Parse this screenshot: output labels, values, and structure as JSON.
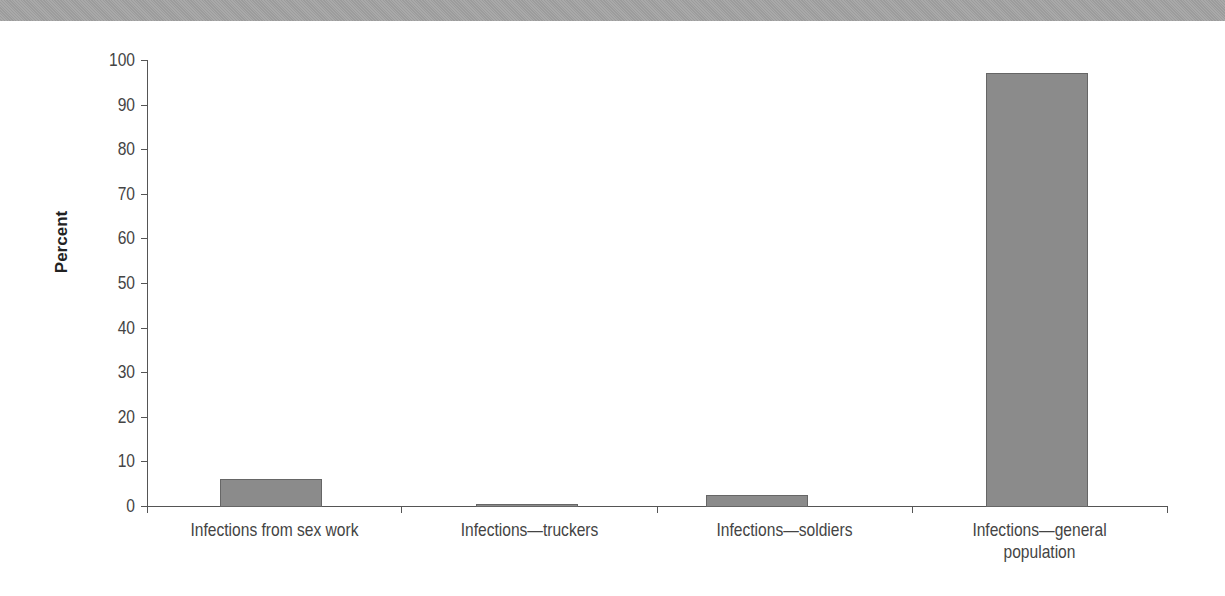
{
  "chart_data": {
    "type": "bar",
    "title": "",
    "xlabel": "",
    "ylabel": "Percent",
    "ylim": [
      0,
      100
    ],
    "yticks": [
      0,
      10,
      20,
      30,
      40,
      50,
      60,
      70,
      80,
      90,
      100
    ],
    "grid": false,
    "legend": null,
    "categories": [
      "Infections from sex work",
      "Infections—truckers",
      "Infections—soldiers",
      "Infections—general population"
    ],
    "values": [
      6,
      0.5,
      2.4,
      97
    ],
    "bar_color": "#8b8b8b"
  },
  "axis": {
    "ylabel": "Percent",
    "yticks": [
      "0",
      "10",
      "20",
      "30",
      "40",
      "50",
      "60",
      "70",
      "80",
      "90",
      "100"
    ]
  },
  "labels": {
    "cat0": "Infections from sex work",
    "cat1": "Infections—truckers",
    "cat2": "Infections—soldiers",
    "cat3_line1": "Infections—general",
    "cat3_line2": "population"
  }
}
